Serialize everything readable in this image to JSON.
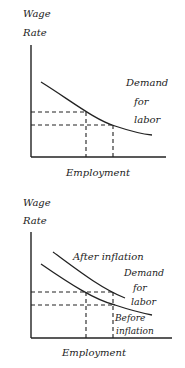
{
  "diagrams": [
    {
      "y_label_line1": "Wage",
      "y_label_line2": "Rate",
      "x_label": "Employment",
      "curve_label_line1": "Demand",
      "curve_label_line2": "for",
      "curve_label_line3": "labor"
    },
    {
      "y_label_line1": "Wage",
      "y_label_line2": "Rate",
      "x_label": "Employment",
      "upper_curve_label": "After inflation",
      "curve_label_line1": "Demand",
      "curve_label_line2": "for",
      "curve_label_line3": "labor",
      "lower_curve_label_line1": "Before",
      "lower_curve_label_line2": "inflation"
    }
  ],
  "colors": {
    "ink": "#222222",
    "background": "#ffffff"
  }
}
